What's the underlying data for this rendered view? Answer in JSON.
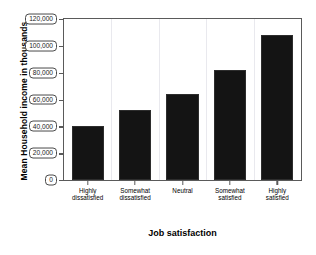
{
  "chart_data": {
    "type": "bar",
    "title": "",
    "xlabel": "Job satisfaction",
    "ylabel": "Mean Household income in thousands",
    "categories": [
      "Highly\ndissatisfied",
      "Somewhat\ndissatisfied",
      "Neutral",
      "Somewhat\nsatisfied",
      "Highly\nsatisfied"
    ],
    "category_lines": [
      [
        "Highly",
        "dissatisfied"
      ],
      [
        "Somewhat",
        "dissatisfied"
      ],
      [
        "Neutral",
        ""
      ],
      [
        "Somewhat",
        "satisfied"
      ],
      [
        "Highly",
        "satisfied"
      ]
    ],
    "values": [
      40000,
      52000,
      64000,
      82000,
      108000
    ],
    "ylim": [
      0,
      120000
    ],
    "yticks": [
      0,
      20000,
      40000,
      60000,
      80000,
      100000,
      120000
    ],
    "ytick_labels": [
      "0",
      "20,000",
      "40,000",
      "60,000",
      "80,000",
      "100,000",
      "120,000"
    ],
    "grid": "vertical-light",
    "legend": "none",
    "bar_color": "#141414",
    "axis_color": "#5a5a5a",
    "background": "#ffffff"
  }
}
